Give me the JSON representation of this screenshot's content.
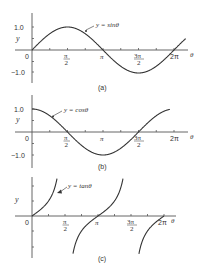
{
  "chart_data": [
    {
      "type": "line",
      "title": "y = sinθ",
      "caption": "(a)",
      "xlabel": "θ",
      "ylabel": "y",
      "x_ticks": [
        "0",
        "π/2",
        "π",
        "3π/2",
        "2π"
      ],
      "y_ticks": [
        "1.0",
        "-1.0"
      ],
      "ylim": [
        -1.0,
        1.0
      ],
      "xlim_rad": [
        0,
        6.8
      ],
      "series": [
        {
          "name": "y = sinθ",
          "function": "sin",
          "x": [
            0,
            1.5708,
            3.1416,
            4.7124,
            6.2832
          ],
          "values": [
            0,
            1,
            0,
            -1,
            0
          ]
        }
      ],
      "annotation": "y = sinθ"
    },
    {
      "type": "line",
      "title": "y = cosθ",
      "caption": "(b)",
      "xlabel": "θ",
      "ylabel": "y",
      "x_ticks": [
        "0",
        "π/2",
        "π",
        "3π/2",
        "2π"
      ],
      "y_ticks": [
        "1.0",
        "-1.0"
      ],
      "ylim": [
        -1.0,
        1.0
      ],
      "xlim_rad": [
        0,
        6.1
      ],
      "series": [
        {
          "name": "y = cosθ",
          "function": "cos",
          "x": [
            0,
            1.5708,
            3.1416,
            4.7124,
            6.2832
          ],
          "values": [
            1,
            0,
            -1,
            0,
            1
          ]
        }
      ],
      "annotation": "y = cosθ"
    },
    {
      "type": "line",
      "title": "y = tanθ",
      "caption": "(c)",
      "xlabel": "θ",
      "ylabel": "y",
      "x_ticks": [
        "0",
        "π/2",
        "π",
        "3π/2",
        "2π"
      ],
      "y_ticks": [],
      "series": [
        {
          "name": "y = tanθ",
          "function": "tan",
          "x": [
            0,
            0.7854,
            3.1416,
            3.927,
            6.2832
          ],
          "values": [
            0,
            1,
            0,
            1,
            0
          ]
        }
      ],
      "annotation": "y = tanθ"
    }
  ],
  "labels": {
    "a": {
      "eq": "y = sinθ",
      "caption": "(a)",
      "y": "y",
      "theta": "θ",
      "zero": "0",
      "one": "1.0",
      "minus_one": "−1.0",
      "pi": "π",
      "two_pi": "2π",
      "pi_num": "π",
      "three_pi_num": "3π",
      "den": "2"
    },
    "b": {
      "eq": "y = cosθ",
      "caption": "(b)",
      "y": "y",
      "theta": "θ",
      "zero": "0",
      "one": "1.0",
      "minus_one": "−1.0",
      "pi": "π",
      "two_pi": "2π",
      "pi_num": "π",
      "three_pi_num": "3π",
      "den": "2"
    },
    "c": {
      "eq": "y = tanθ",
      "caption": "(c)",
      "y": "y",
      "theta": "θ",
      "zero": "0",
      "pi": "π",
      "two_pi": "2π",
      "pi_num": "π",
      "three_pi_num": "3π",
      "den": "2"
    }
  }
}
